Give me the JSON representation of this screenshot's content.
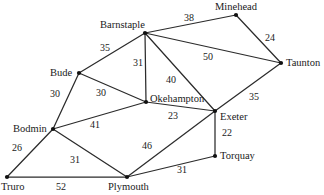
{
  "diagram": {
    "type": "weighted-undirected-graph",
    "colors": {
      "background": "#ffffff",
      "edge": "#2b2b2b",
      "node": "#111111",
      "text": "#1a1a1a"
    },
    "nodes": [
      {
        "id": "barnstaple",
        "label": "Barnstaple",
        "x": 145,
        "y": 33,
        "label_x": 100,
        "label_y": 20,
        "anchor": "left"
      },
      {
        "id": "minehead",
        "label": "Minehead",
        "x": 236,
        "y": 15,
        "label_x": 215,
        "label_y": 2,
        "anchor": "left"
      },
      {
        "id": "taunton",
        "label": "Taunton",
        "x": 281,
        "y": 63,
        "label_x": 286,
        "label_y": 58,
        "anchor": "left"
      },
      {
        "id": "bude",
        "label": "Bude",
        "x": 79,
        "y": 73,
        "label_x": 50,
        "label_y": 68,
        "anchor": "left"
      },
      {
        "id": "okehampton",
        "label": "Okehampton",
        "x": 146,
        "y": 102,
        "label_x": 150,
        "label_y": 94,
        "anchor": "left"
      },
      {
        "id": "exeter",
        "label": "Exeter",
        "x": 215,
        "y": 111,
        "label_x": 220,
        "label_y": 112,
        "anchor": "left"
      },
      {
        "id": "bodmin",
        "label": "Bodmin",
        "x": 53,
        "y": 129,
        "label_x": 13,
        "label_y": 124,
        "anchor": "left"
      },
      {
        "id": "torquay",
        "label": "Torquay",
        "x": 215,
        "y": 156,
        "label_x": 220,
        "label_y": 151,
        "anchor": "left"
      },
      {
        "id": "truro",
        "label": "Truro",
        "x": 7,
        "y": 177,
        "label_x": 1,
        "label_y": 182,
        "anchor": "left"
      },
      {
        "id": "plymouth",
        "label": "Plymouth",
        "x": 127,
        "y": 177,
        "label_x": 108,
        "label_y": 182,
        "anchor": "left"
      }
    ],
    "edges": [
      {
        "from": "barnstaple",
        "to": "minehead",
        "weight": 38,
        "label_x": 184,
        "label_y": 13
      },
      {
        "from": "minehead",
        "to": "taunton",
        "weight": 24,
        "label_x": 265,
        "label_y": 33
      },
      {
        "from": "barnstaple",
        "to": "taunton",
        "weight": 50,
        "label_x": 203,
        "label_y": 52
      },
      {
        "from": "barnstaple",
        "to": "bude",
        "weight": 35,
        "label_x": 100,
        "label_y": 43
      },
      {
        "from": "barnstaple",
        "to": "okehampton",
        "weight": 31,
        "label_x": 133,
        "label_y": 58
      },
      {
        "from": "barnstaple",
        "to": "exeter",
        "weight": 40,
        "label_x": 166,
        "label_y": 75
      },
      {
        "from": "bude",
        "to": "bodmin",
        "weight": 30,
        "label_x": 50,
        "label_y": 89
      },
      {
        "from": "bude",
        "to": "okehampton",
        "weight": 30,
        "label_x": 96,
        "label_y": 88
      },
      {
        "from": "bodmin",
        "to": "okehampton",
        "weight": 41,
        "label_x": 90,
        "label_y": 120
      },
      {
        "from": "okehampton",
        "to": "exeter",
        "weight": 23,
        "label_x": 168,
        "label_y": 111
      },
      {
        "from": "exeter",
        "to": "taunton",
        "weight": 35,
        "label_x": 249,
        "label_y": 92
      },
      {
        "from": "exeter",
        "to": "torquay",
        "weight": 22,
        "label_x": 222,
        "label_y": 128
      },
      {
        "from": "bodmin",
        "to": "truro",
        "weight": 26,
        "label_x": 12,
        "label_y": 143
      },
      {
        "from": "bodmin",
        "to": "plymouth",
        "weight": 31,
        "label_x": 70,
        "label_y": 155
      },
      {
        "from": "exeter",
        "to": "plymouth",
        "weight": 46,
        "label_x": 142,
        "label_y": 141
      },
      {
        "from": "torquay",
        "to": "plymouth",
        "weight": 31,
        "label_x": 177,
        "label_y": 165
      },
      {
        "from": "truro",
        "to": "plymouth",
        "weight": 52,
        "label_x": 56,
        "label_y": 182
      }
    ]
  }
}
